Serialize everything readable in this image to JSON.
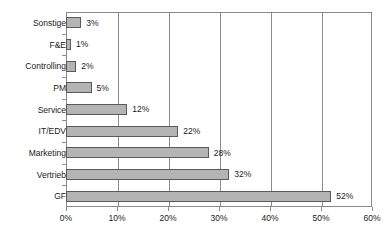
{
  "chart_data": {
    "type": "bar",
    "orientation": "horizontal",
    "title": "",
    "subtitle": "",
    "xlabel": "",
    "ylabel": "",
    "categories": [
      "GF",
      "Vertrieb",
      "Marketing",
      "IT/EDV",
      "Service",
      "PM",
      "Controlling",
      "F&E",
      "Sonstige"
    ],
    "values": [
      52,
      32,
      28,
      22,
      12,
      5,
      2,
      1,
      3
    ],
    "data_labels": [
      "52%",
      "32%",
      "28%",
      "22%",
      "12%",
      "5%",
      "2%",
      "1%",
      "3%"
    ],
    "xlim": [
      0,
      60
    ],
    "xticks": [
      0,
      10,
      20,
      30,
      40,
      50,
      60
    ],
    "xtick_labels": [
      "0%",
      "10%",
      "20%",
      "30%",
      "40%",
      "50%",
      "60%"
    ],
    "grid": "vertical",
    "legend": "none",
    "colors": {
      "bar_fill": "#b4b4b4",
      "bar_border": "#5a5a5a",
      "gridline": "#8d8d8d",
      "axis": "#888888",
      "text": "#1a1a1a",
      "background": "#ffffff"
    }
  }
}
